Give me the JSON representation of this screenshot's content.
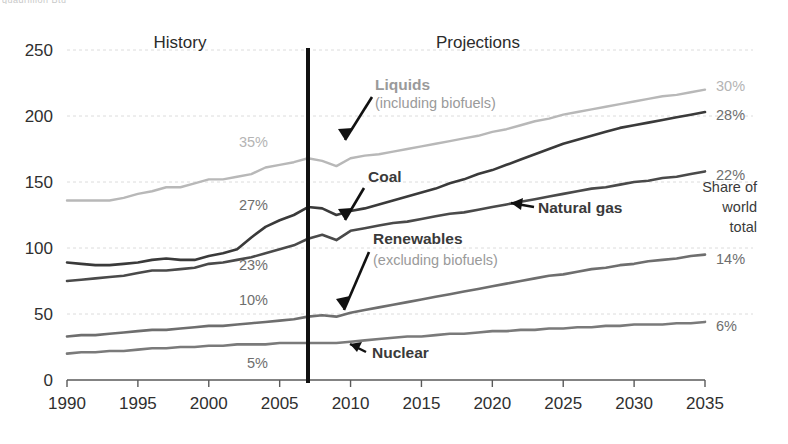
{
  "figure": {
    "top_clipped_note": "quadrillion Btu",
    "period_history": "History",
    "period_projections": "Projections",
    "share_caption_line1": "Share of",
    "share_caption_line2": "world",
    "share_caption_line3": "total"
  },
  "chart_data": {
    "type": "line",
    "title": "",
    "xlabel": "",
    "ylabel": "",
    "xlim": [
      1990,
      2035
    ],
    "ylim": [
      0,
      250
    ],
    "grid": true,
    "legend_position": "inline-annotations",
    "divider_year": 2007,
    "divider_labels": {
      "left": "History",
      "right": "Projections"
    },
    "xticks": [
      1990,
      1995,
      2000,
      2005,
      2010,
      2015,
      2020,
      2025,
      2030,
      2035
    ],
    "yticks": [
      0,
      50,
      100,
      150,
      200,
      250
    ],
    "x": [
      1990,
      1991,
      1992,
      1993,
      1994,
      1995,
      1996,
      1997,
      1998,
      1999,
      2000,
      2001,
      2002,
      2003,
      2004,
      2005,
      2006,
      2007,
      2008,
      2009,
      2010,
      2011,
      2012,
      2013,
      2014,
      2015,
      2016,
      2017,
      2018,
      2019,
      2020,
      2021,
      2022,
      2023,
      2024,
      2025,
      2026,
      2027,
      2028,
      2029,
      2030,
      2031,
      2032,
      2033,
      2034,
      2035
    ],
    "series": [
      {
        "name": "Liquids",
        "sublabel": "(including biofuels)",
        "color": "#b8b8b8",
        "start_share_pct": "35%",
        "end_share_pct": "30%",
        "values": [
          136,
          136,
          136,
          136,
          138,
          141,
          143,
          146,
          146,
          149,
          152,
          152,
          154,
          156,
          161,
          163,
          165,
          168,
          166,
          162,
          168,
          170,
          171,
          173,
          175,
          177,
          179,
          181,
          183,
          185,
          188,
          190,
          193,
          196,
          198,
          201,
          203,
          205,
          207,
          209,
          211,
          213,
          215,
          216,
          218,
          220
        ]
      },
      {
        "name": "Coal",
        "sublabel": "",
        "color": "#3a3a3a",
        "start_share_pct": "27%",
        "end_share_pct": "28%",
        "values": [
          89,
          88,
          87,
          87,
          88,
          89,
          91,
          92,
          91,
          91,
          94,
          96,
          99,
          108,
          116,
          121,
          125,
          131,
          130,
          125,
          128,
          130,
          133,
          136,
          139,
          142,
          145,
          149,
          152,
          156,
          159,
          163,
          167,
          171,
          175,
          179,
          182,
          185,
          188,
          191,
          193,
          195,
          197,
          199,
          201,
          203
        ]
      },
      {
        "name": "Natural gas",
        "sublabel": "",
        "color": "#4a4a4a",
        "start_share_pct": "23%",
        "end_share_pct": "22%",
        "values": [
          75,
          76,
          77,
          78,
          79,
          81,
          83,
          83,
          84,
          85,
          88,
          89,
          91,
          93,
          96,
          99,
          102,
          107,
          110,
          106,
          113,
          115,
          117,
          119,
          120,
          122,
          124,
          126,
          127,
          129,
          131,
          133,
          135,
          137,
          139,
          141,
          143,
          145,
          146,
          148,
          150,
          151,
          153,
          154,
          156,
          158
        ]
      },
      {
        "name": "Renewables",
        "sublabel": "(excluding biofuels)",
        "color": "#6e6e6e",
        "start_share_pct": "10%",
        "end_share_pct": "14%",
        "values": [
          33,
          34,
          34,
          35,
          36,
          37,
          38,
          38,
          39,
          40,
          41,
          41,
          42,
          43,
          44,
          45,
          46,
          48,
          49,
          48,
          51,
          53,
          55,
          57,
          59,
          61,
          63,
          65,
          67,
          69,
          71,
          73,
          75,
          77,
          79,
          80,
          82,
          84,
          85,
          87,
          88,
          90,
          91,
          92,
          94,
          95
        ]
      },
      {
        "name": "Nuclear",
        "sublabel": "",
        "color": "#7a7a7a",
        "start_share_pct": "5%",
        "end_share_pct": "6%",
        "values": [
          20,
          21,
          21,
          22,
          22,
          23,
          24,
          24,
          25,
          25,
          26,
          26,
          27,
          27,
          27,
          28,
          28,
          28,
          28,
          28,
          29,
          30,
          31,
          32,
          33,
          33,
          34,
          35,
          35,
          36,
          37,
          37,
          38,
          38,
          39,
          39,
          40,
          40,
          41,
          41,
          42,
          42,
          42,
          43,
          43,
          44
        ]
      }
    ],
    "left_share_labels": [
      {
        "text": "35%",
        "value": 35,
        "series": "Liquids"
      },
      {
        "text": "27%",
        "value": 27,
        "series": "Coal"
      },
      {
        "text": "23%",
        "value": 23,
        "series": "Natural gas"
      },
      {
        "text": "10%",
        "value": 10,
        "series": "Renewables"
      },
      {
        "text": "5%",
        "value": 5,
        "series": "Nuclear"
      }
    ],
    "right_share_labels": [
      {
        "text": "30%",
        "value": 30,
        "series": "Liquids"
      },
      {
        "text": "28%",
        "value": 28,
        "series": "Coal"
      },
      {
        "text": "22%",
        "value": 22,
        "series": "Natural gas"
      },
      {
        "text": "14%",
        "value": 14,
        "series": "Renewables"
      },
      {
        "text": "6%",
        "value": 6,
        "series": "Nuclear"
      }
    ]
  }
}
